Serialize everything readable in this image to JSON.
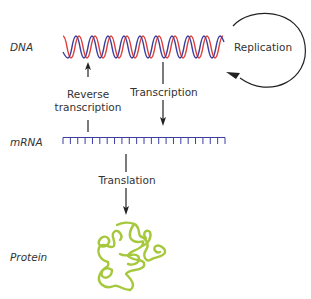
{
  "diagram": {
    "molecules": {
      "dna": "DNA",
      "mrna": "mRNA",
      "protein": "Protein"
    },
    "processes": {
      "replication": "Replication",
      "reverse_transcription_line1": "Reverse",
      "reverse_transcription_line2": "transcription",
      "transcription": "Transcription",
      "translation": "Translation"
    },
    "colors": {
      "dna_strand_1": "#e0403c",
      "dna_strand_2": "#3d3f9e",
      "mrna": "#3d3f9e",
      "protein": "#a6c83c",
      "arrow": "#222222"
    }
  }
}
